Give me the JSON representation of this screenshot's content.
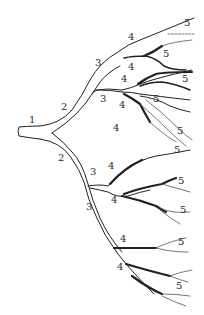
{
  "diagram": {
    "labels": [
      {
        "text": "1",
        "x": 29,
        "y": 120
      },
      {
        "text": "2",
        "x": 61,
        "y": 107
      },
      {
        "text": "2",
        "x": 58,
        "y": 158
      },
      {
        "text": "3",
        "x": 95,
        "y": 63
      },
      {
        "text": "3",
        "x": 100,
        "y": 99
      },
      {
        "text": "3",
        "x": 90,
        "y": 172
      },
      {
        "text": "3",
        "x": 86,
        "y": 207
      },
      {
        "text": "4",
        "x": 128,
        "y": 37
      },
      {
        "text": "4",
        "x": 128,
        "y": 67
      },
      {
        "text": "4",
        "x": 121,
        "y": 79
      },
      {
        "text": "4",
        "x": 119,
        "y": 105
      },
      {
        "text": "4",
        "x": 113,
        "y": 128
      },
      {
        "text": "4",
        "x": 108,
        "y": 166
      },
      {
        "text": "4",
        "x": 111,
        "y": 200
      },
      {
        "text": "4",
        "x": 120,
        "y": 239
      },
      {
        "text": "4",
        "x": 117,
        "y": 267
      },
      {
        "text": "5",
        "x": 184,
        "y": 23
      },
      {
        "text": "5",
        "x": 163,
        "y": 54
      },
      {
        "text": "5",
        "x": 182,
        "y": 79
      },
      {
        "text": "5",
        "x": 153,
        "y": 99
      },
      {
        "text": "5",
        "x": 177,
        "y": 131
      },
      {
        "text": "5",
        "x": 174,
        "y": 150
      },
      {
        "text": "5",
        "x": 178,
        "y": 181
      },
      {
        "text": "5",
        "x": 180,
        "y": 210
      },
      {
        "text": "5",
        "x": 178,
        "y": 242
      },
      {
        "text": "5",
        "x": 176,
        "y": 286
      }
    ]
  }
}
